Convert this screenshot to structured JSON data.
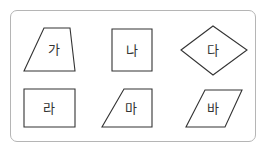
{
  "diagram": {
    "frame": {
      "border_color": "#b5b5b5"
    },
    "stroke_color": "#333333",
    "shapes": [
      {
        "id": "ga",
        "label": "가",
        "kind": "trapezoid",
        "points": "44,28 70,28 75,71 24,71",
        "label_pos": [
          51,
          49
        ]
      },
      {
        "id": "na",
        "label": "나",
        "kind": "square",
        "points": "112,29 152,29 152,71 112,71",
        "label_pos": [
          132,
          50
        ]
      },
      {
        "id": "da",
        "label": "다",
        "kind": "rhombus",
        "points": "181,50 213,26 247,50 213,75",
        "label_pos": [
          213,
          50
        ]
      },
      {
        "id": "ra",
        "label": "라",
        "kind": "rectangle",
        "points": "24,89 75,89 75,127 24,127",
        "label_pos": [
          48,
          108
        ]
      },
      {
        "id": "ma",
        "label": "마",
        "kind": "trapezoid",
        "points": "124,89 152,89 152,127 102,127",
        "label_pos": [
          131,
          108
        ]
      },
      {
        "id": "ba",
        "label": "바",
        "kind": "parallelogram",
        "points": "205,90 242,90 225,127 186,127",
        "label_pos": [
          213,
          108
        ]
      }
    ]
  }
}
